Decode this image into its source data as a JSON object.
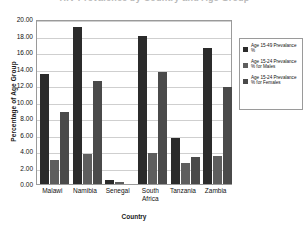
{
  "chart_data": {
    "type": "bar",
    "title": "HIV Prevalence by Country and Age Group",
    "xlabel": "Country",
    "ylabel": "Percentage of Age Group",
    "ylim": [
      0,
      20
    ],
    "ytick_step": 2,
    "grid": true,
    "legend_position": "right",
    "categories": [
      "Malawi",
      "Namibia",
      "Senegal",
      "South Africa",
      "Tanzania",
      "Zambia"
    ],
    "category_lines": [
      [
        "Malawi"
      ],
      [
        "Namibia"
      ],
      [
        "Senegal"
      ],
      [
        "South",
        "Africa"
      ],
      [
        "Tanzania"
      ],
      [
        "Zambia"
      ]
    ],
    "ytick_labels": [
      "20.00",
      "18.00",
      "16.00",
      "14.00",
      "12.00",
      "10.00",
      "8.00",
      "6.00",
      "4.00",
      "2.00",
      "0.00"
    ],
    "ytick_values": [
      20,
      18,
      16,
      14,
      12,
      10,
      8,
      6,
      4,
      2,
      0
    ],
    "series": [
      {
        "name": "Age 15-49 Prevalance %",
        "color": "#2b2b2b",
        "values": [
          13.3,
          19.0,
          0.5,
          18.0,
          5.6,
          16.5
        ]
      },
      {
        "name": "Age 15-24 Prevalance % for Males",
        "color": "#5e5e5e",
        "values": [
          2.9,
          3.6,
          0.2,
          3.7,
          2.5,
          3.4
        ]
      },
      {
        "name": "Age 15-24 Prevalance % for Females",
        "color": "#4a4a4a",
        "values": [
          8.7,
          12.5,
          0.0,
          13.6,
          3.3,
          11.8
        ]
      }
    ]
  },
  "legend": {
    "items": [
      {
        "label": "Age 15-49 Prevalance %"
      },
      {
        "label": "Age 15-24 Prevalance % for Males"
      },
      {
        "label": "Age 15-24 Prevalance % for Females"
      }
    ]
  }
}
